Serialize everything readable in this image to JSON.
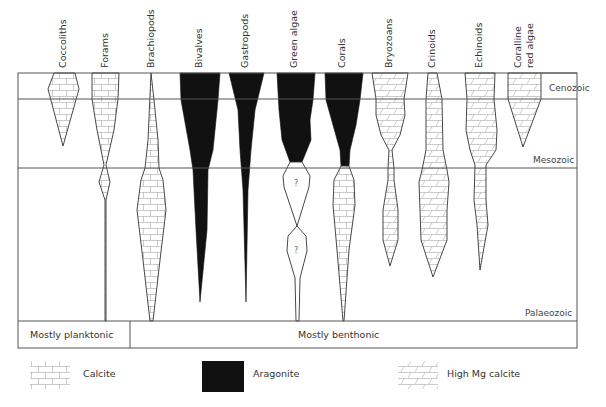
{
  "diagram": {
    "title": "",
    "taxa": [
      {
        "name": "Coccoliths",
        "mineral": "Calcite"
      },
      {
        "name": "Forams",
        "mineral": "Calcite"
      },
      {
        "name": "Brachiopods",
        "mineral": "Calcite"
      },
      {
        "name": "Bivalves",
        "mineral": "Aragonite"
      },
      {
        "name": "Gastropods",
        "mineral": "Aragonite"
      },
      {
        "name": "Green algae",
        "mineral": "Aragonite"
      },
      {
        "name": "Corals",
        "mineral": "Aragonite / Calcite"
      },
      {
        "name": "Bryozoans",
        "mineral": "High Mg calcite"
      },
      {
        "name": "Crinoids",
        "mineral": "High Mg calcite"
      },
      {
        "name": "Echinoids",
        "mineral": "High Mg calcite"
      },
      {
        "name": "Coralline",
        "name2": "red algae",
        "mineral": "High Mg calcite"
      }
    ],
    "eras": {
      "cenozoic": "Cenozoic",
      "mesozoic": "Mesozoic",
      "palaeozoic": "Palaeozoic"
    },
    "modes": {
      "planktonic": "Mostly planktonic",
      "benthonic": "Mostly benthonic"
    },
    "unknown_marker": "?",
    "legend": {
      "calcite": "Calcite",
      "aragonite": "Aragonite",
      "high_mg": "High Mg calcite"
    },
    "colors": {
      "aragonite_fill": "#111111",
      "line": "#555555",
      "pattern": "#aaaaaa"
    }
  }
}
